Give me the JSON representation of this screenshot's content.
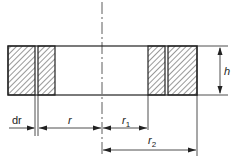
{
  "diagram": {
    "type": "cross-section of annular ring (hatched) with thin element dr",
    "labels": {
      "height": "h",
      "dr": "dr",
      "r": "r",
      "r1": "r",
      "r1_sub": "1",
      "r2": "r",
      "r2_sub": "2"
    },
    "colors": {
      "line": "#222222",
      "background": "#ffffff"
    }
  }
}
